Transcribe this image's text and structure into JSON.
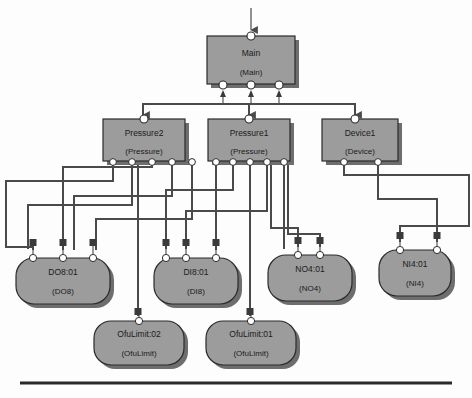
{
  "diagram": {
    "colors": {
      "node_fill": "#9c9c9c",
      "node_stroke": "#2b2b2b",
      "node_shadow": "#6e6e6e",
      "port_fill": "#ffffff",
      "port_stroke": "#2b2b2b",
      "square_port_fill": "#3a3a3a",
      "line": "#4a4a4a",
      "rule": "#2a2a2a",
      "background": "#fdfdfd"
    },
    "nodes": [
      {
        "id": "main",
        "name": "Main",
        "type": "(Main)",
        "shape": "rect",
        "x": 207,
        "y": 36,
        "w": 88,
        "h": 48,
        "top_ports": 1,
        "bottom_ports": 3
      },
      {
        "id": "pressure2",
        "name": "Pressure2",
        "type": "(Pressure)",
        "shape": "rect",
        "x": 103,
        "y": 119,
        "w": 82,
        "h": 42,
        "top_ports": 1,
        "bottom_ports": 5
      },
      {
        "id": "pressure1",
        "name": "Pressure1",
        "type": "(Pressure)",
        "shape": "rect",
        "x": 208,
        "y": 119,
        "w": 82,
        "h": 42,
        "top_ports": 1,
        "bottom_ports": 5
      },
      {
        "id": "device1",
        "name": "Device1",
        "type": "(Device)",
        "shape": "rect",
        "x": 322,
        "y": 119,
        "w": 76,
        "h": 42,
        "top_ports": 1,
        "bottom_ports": 2
      },
      {
        "id": "do8",
        "name": "DO8:01",
        "type": "(DO8)",
        "shape": "rounded",
        "x": 16,
        "y": 258,
        "w": 94,
        "h": 46,
        "top_ports": 3,
        "bottom_ports": 0
      },
      {
        "id": "di8",
        "name": "DI8:01",
        "type": "(DI8)",
        "shape": "rounded",
        "x": 154,
        "y": 258,
        "w": 84,
        "h": 46,
        "top_ports": 3,
        "bottom_ports": 0
      },
      {
        "id": "no4",
        "name": "NO4:01",
        "type": "(NO4)",
        "shape": "rounded",
        "x": 268,
        "y": 255,
        "w": 84,
        "h": 46,
        "top_ports": 2,
        "bottom_ports": 0
      },
      {
        "id": "ni4",
        "name": "NI4:01",
        "type": "(NI4)",
        "shape": "rounded",
        "x": 379,
        "y": 250,
        "w": 72,
        "h": 46,
        "top_ports": 2,
        "bottom_ports": 0
      },
      {
        "id": "ofulimit02",
        "name": "OfuLimit:02",
        "type": "(OfuLimit)",
        "shape": "rounded",
        "x": 94,
        "y": 321,
        "w": 90,
        "h": 44,
        "top_ports": 1,
        "bottom_ports": 0
      },
      {
        "id": "ofulimit01",
        "name": "OfuLimit:01",
        "type": "(OfuLimit)",
        "shape": "rounded",
        "x": 206,
        "y": 321,
        "w": 90,
        "h": 44,
        "top_ports": 1,
        "bottom_ports": 0
      }
    ],
    "entry_arrow": {
      "x": 251,
      "y_from": 8,
      "y_to": 32
    },
    "bottom_rule": {
      "x1": 20,
      "x2": 452,
      "y": 383
    }
  }
}
